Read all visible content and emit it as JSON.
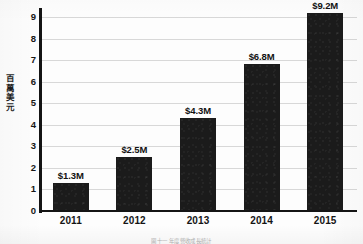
{
  "figure": {
    "y_axis_title_chars": [
      "百",
      "萬",
      "美",
      "元"
    ],
    "y_axis_title": "百萬美元",
    "caption": "圖十一 年度營收成長統計"
  },
  "chart_data": {
    "type": "bar",
    "title": "",
    "subtitle": "",
    "xlabel": "",
    "ylabel": "百萬美元",
    "categories": [
      "2011",
      "2012",
      "2013",
      "2014",
      "2015"
    ],
    "values": [
      1.3,
      2.5,
      4.3,
      6.8,
      9.2
    ],
    "data_labels": [
      "$1.3M",
      "$2.5M",
      "$4.3M",
      "$6.8M",
      "$9.2M"
    ],
    "ylim": [
      0,
      9
    ],
    "ytick_labels": [
      "0",
      "1",
      "2",
      "3",
      "4",
      "5",
      "6",
      "7",
      "8",
      "9"
    ],
    "ytick_values": [
      0,
      1,
      2,
      3,
      4,
      5,
      6,
      7,
      8,
      9
    ],
    "grid": true,
    "grid_axis": "y",
    "legend": false,
    "legend_position": "none",
    "bar_color": "#1b1b1b",
    "grid_color": "#d8d8d8",
    "axis_color": "#141414",
    "background_color": "#ffffff",
    "units": "millions USD"
  }
}
